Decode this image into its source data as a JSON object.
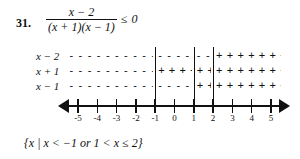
{
  "problem": {
    "number": "31.",
    "inequality": {
      "numerator": "x − 2",
      "denominator": "(x + 1)(x − 1)",
      "relation": "≤",
      "right_side": "0"
    }
  },
  "sign_chart": {
    "rows": [
      {
        "label": "x − 2",
        "segments": [
          {
            "sign": "−",
            "marks": "- - - - - - - - - - - -",
            "from": -5.6,
            "to": -1.0
          },
          {
            "sign": "−",
            "marks": "- - - - - -",
            "from": -1.0,
            "to": 1.0
          },
          {
            "sign": "−",
            "marks": "- - -",
            "from": 1.0,
            "to": 2.0
          },
          {
            "sign": "+",
            "marks": "+ + + + + + + +",
            "from": 2.0,
            "to": 5.6
          }
        ]
      },
      {
        "label": "x + 1",
        "segments": [
          {
            "sign": "−",
            "marks": "- - - - - - - - - - - -",
            "from": -5.6,
            "to": -1.0
          },
          {
            "sign": "+",
            "marks": "+ + + +",
            "from": -1.0,
            "to": 1.0
          },
          {
            "sign": "+",
            "marks": "+ +",
            "from": 1.0,
            "to": 2.0
          },
          {
            "sign": "+",
            "marks": "+ + + + + + + +",
            "from": 2.0,
            "to": 5.6
          }
        ]
      },
      {
        "label": "x − 1",
        "segments": [
          {
            "sign": "−",
            "marks": "- - - - - - - - - - - -",
            "from": -5.6,
            "to": -1.0
          },
          {
            "sign": "−",
            "marks": "- - - - - -",
            "from": -1.0,
            "to": 1.0
          },
          {
            "sign": "+",
            "marks": "+ +",
            "from": 1.0,
            "to": 2.0
          },
          {
            "sign": "+",
            "marks": "+ + + + + + + +",
            "from": 2.0,
            "to": 5.6
          }
        ]
      }
    ],
    "critical_values": [
      -1,
      1,
      2
    ]
  },
  "number_line": {
    "min": -5.9,
    "max": 5.9,
    "ticks": [
      -5,
      -4,
      -3,
      -2,
      -1,
      0,
      1,
      2,
      3,
      4,
      5
    ],
    "tick_labels": [
      "-5",
      "-4",
      "-3",
      "-2",
      "-1",
      "0",
      "1",
      "2",
      "3",
      "4",
      "5"
    ],
    "left_arrow": "◀",
    "right_arrow": "▶"
  },
  "solution_set": "{x | x < −1 or 1 < x ≤ 2}",
  "colors": {
    "ink": "#111111",
    "page": "#ffffff"
  }
}
